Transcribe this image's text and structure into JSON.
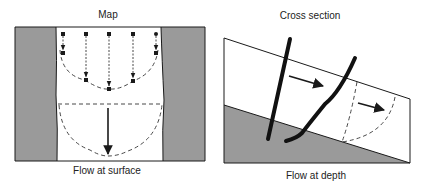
{
  "map_panel": {
    "title": "Map",
    "caption": "Flow at surface"
  },
  "cross_section_panel": {
    "title": "Cross section",
    "caption": "Flow at depth"
  },
  "colors": {
    "rock": "#9a9a9a",
    "line": "#1a1a1a",
    "background": "#ffffff"
  }
}
